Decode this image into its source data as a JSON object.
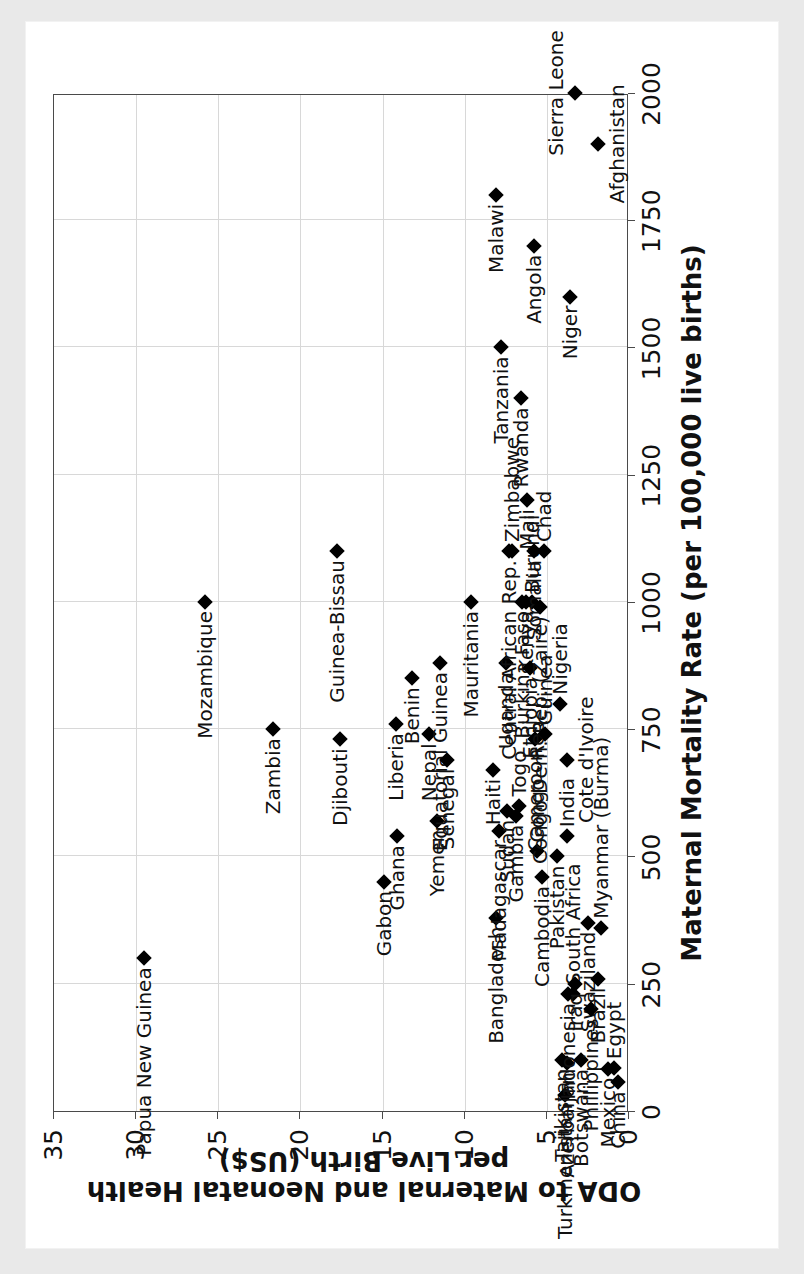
{
  "figure": {
    "x_axis": {
      "title": "Maternal Mortality Rate (per 100,000 live births)",
      "ticks": [
        0,
        250,
        500,
        750,
        1000,
        1250,
        1500,
        1750,
        2000
      ],
      "min": 0,
      "max": 2000
    },
    "y_axis": {
      "title": "ODA to Maternal and Neonatal Health per Live Birth (US$)",
      "ticks": [
        0,
        5,
        10,
        15,
        20,
        25,
        30,
        35
      ],
      "min": 0,
      "max": 35
    },
    "grid": true,
    "marker_color": "#000000",
    "frame_color": "#4a4a4a",
    "grid_color": "#d8d8d8"
  },
  "chart_data": {
    "type": "scatter",
    "title": "",
    "xlabel": "Maternal Mortality Rate (per 100,000 live births)",
    "ylabel": "ODA to Maternal and Neonatal Health per Live Birth (US$)",
    "xlim": [
      0,
      2000
    ],
    "ylim": [
      0,
      35
    ],
    "xticks": [
      0,
      250,
      500,
      750,
      1000,
      1250,
      1500,
      1750,
      2000
    ],
    "yticks": [
      0,
      5,
      10,
      15,
      20,
      25,
      30,
      35
    ],
    "grid": true,
    "legend": null,
    "point_label_key": "country",
    "points": [
      {
        "country": "Papua New Guinea",
        "x": 300,
        "y": 29.5,
        "pos": "r"
      },
      {
        "country": "Mozambique",
        "x": 1000,
        "y": 25.8,
        "pos": "r"
      },
      {
        "country": "Zambia",
        "x": 750,
        "y": 21.7,
        "pos": "r"
      },
      {
        "country": "Guinea-Bissau",
        "x": 1100,
        "y": 17.8,
        "pos": "r"
      },
      {
        "country": "Djibouti",
        "x": 730,
        "y": 17.6,
        "pos": "r"
      },
      {
        "country": "Gabon",
        "x": 450,
        "y": 14.9,
        "pos": "r"
      },
      {
        "country": "Liberia",
        "x": 760,
        "y": 14.2,
        "pos": "r"
      },
      {
        "country": "Ghana",
        "x": 540,
        "y": 14.1,
        "pos": "r"
      },
      {
        "country": "Benin",
        "x": 850,
        "y": 13.2,
        "pos": "r"
      },
      {
        "country": "Nepal",
        "x": 740,
        "y": 12.2,
        "pos": "r"
      },
      {
        "country": "Yemen",
        "x": 570,
        "y": 11.7,
        "pos": "r"
      },
      {
        "country": "Equatorial Guinea",
        "x": 880,
        "y": 11.5,
        "pos": "r"
      },
      {
        "country": "Senegal",
        "x": 690,
        "y": 11.1,
        "pos": "r"
      },
      {
        "country": "Mauritania",
        "x": 1000,
        "y": 9.6,
        "pos": "r"
      },
      {
        "country": "Haiti",
        "x": 670,
        "y": 8.3,
        "pos": "r"
      },
      {
        "country": "Bangladesh",
        "x": 380,
        "y": 8.1,
        "pos": "r"
      },
      {
        "country": "Madagascar",
        "x": 550,
        "y": 7.9,
        "pos": "r"
      },
      {
        "country": "Uganda",
        "x": 880,
        "y": 7.5,
        "pos": "r"
      },
      {
        "country": "Sudan",
        "x": 590,
        "y": 7.4,
        "pos": "r"
      },
      {
        "country": "Central African Rep.",
        "x": 1100,
        "y": 7.3,
        "pos": "r"
      },
      {
        "country": "Zimbabwe",
        "x": 1100,
        "y": 7.1,
        "pos": "l"
      },
      {
        "country": "Gambia",
        "x": 580,
        "y": 6.9,
        "pos": "r"
      },
      {
        "country": "Togo",
        "x": 600,
        "y": 6.7,
        "pos": "l"
      },
      {
        "country": "Burkina Faso",
        "x": 1000,
        "y": 6.5,
        "pos": "r"
      },
      {
        "country": "Kenya",
        "x": 1000,
        "y": 6.3,
        "pos": "r"
      },
      {
        "country": "Mali",
        "x": 1200,
        "y": 6.2,
        "pos": "r"
      },
      {
        "country": "Ethiopia",
        "x": 870,
        "y": 6.0,
        "pos": "r"
      },
      {
        "country": "Burundi",
        "x": 1000,
        "y": 5.9,
        "pos": "l"
      },
      {
        "country": "Somalia",
        "x": 1100,
        "y": 5.8,
        "pos": "r"
      },
      {
        "country": "Cameroon",
        "x": 730,
        "y": 5.7,
        "pos": "r"
      },
      {
        "country": "Congo - Rep.",
        "x": 510,
        "y": 5.6,
        "pos": "l"
      },
      {
        "country": "Congo Dem. Rep. (Zaire)",
        "x": 990,
        "y": 5.4,
        "pos": "r"
      },
      {
        "country": "Cambodia",
        "x": 460,
        "y": 5.3,
        "pos": "r"
      },
      {
        "country": "Chad",
        "x": 1100,
        "y": 5.2,
        "pos": "l"
      },
      {
        "country": "Guinea",
        "x": 740,
        "y": 5.1,
        "pos": "l"
      },
      {
        "country": "Pakistan",
        "x": 500,
        "y": 4.4,
        "pos": "r"
      },
      {
        "country": "Nigeria",
        "x": 800,
        "y": 4.2,
        "pos": "l"
      },
      {
        "country": "Tajikistan",
        "x": 100,
        "y": 4.1,
        "pos": "r"
      },
      {
        "country": "Turkmenistan",
        "x": 31,
        "y": 3.9,
        "pos": "r"
      },
      {
        "country": "Cote d'Ivoire",
        "x": 690,
        "y": 3.8,
        "pos": "b"
      },
      {
        "country": "India",
        "x": 540,
        "y": 3.8,
        "pos": "l"
      },
      {
        "country": "Azerbaijan",
        "x": 94,
        "y": 3.8,
        "pos": "r"
      },
      {
        "country": "Indonesia",
        "x": 230,
        "y": 3.7,
        "pos": "r"
      },
      {
        "country": "South Africa",
        "x": 230,
        "y": 3.4,
        "pos": "l"
      },
      {
        "country": "Iraq",
        "x": 250,
        "y": 3.3,
        "pos": "r"
      },
      {
        "country": "Botswana",
        "x": 100,
        "y": 2.9,
        "pos": "r"
      },
      {
        "country": "Swaziland",
        "x": 370,
        "y": 2.5,
        "pos": "r"
      },
      {
        "country": "Phillippines",
        "x": 200,
        "y": 2.3,
        "pos": "r"
      },
      {
        "country": "Brazil",
        "x": 260,
        "y": 1.9,
        "pos": "r"
      },
      {
        "country": "Myanmar (Burma)",
        "x": 360,
        "y": 1.7,
        "pos": "l"
      },
      {
        "country": "Mexico",
        "x": 83,
        "y": 1.3,
        "pos": "r"
      },
      {
        "country": "Egypt",
        "x": 84,
        "y": 0.9,
        "pos": "l"
      },
      {
        "country": "China",
        "x": 56,
        "y": 0.7,
        "pos": "r"
      },
      {
        "country": "Rwanda",
        "x": 1400,
        "y": 6.6,
        "pos": "r"
      },
      {
        "country": "Tanzania",
        "x": 1500,
        "y": 7.8,
        "pos": "r"
      },
      {
        "country": "Niger",
        "x": 1600,
        "y": 3.6,
        "pos": "r"
      },
      {
        "country": "Angola",
        "x": 1700,
        "y": 5.8,
        "pos": "r"
      },
      {
        "country": "Malawi",
        "x": 1800,
        "y": 8.1,
        "pos": "r"
      },
      {
        "country": "Afghanistan",
        "x": 1900,
        "y": 1.9,
        "pos": "b"
      },
      {
        "country": "Sierra Leone",
        "x": 2000,
        "y": 3.3,
        "pos": "a"
      }
    ]
  }
}
